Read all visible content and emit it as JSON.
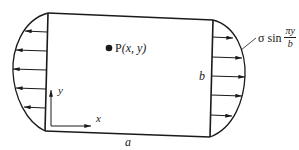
{
  "diagram": {
    "labels": {
      "point": "P(x, y)",
      "point_letter": "P",
      "point_args": "(x, y)",
      "height": "b",
      "width": "a",
      "x_axis": "x",
      "y_axis": "y",
      "load_prefix": "σ sin",
      "load_numerator": "πy",
      "load_denominator": "b"
    },
    "colors": {
      "stroke": "#1a1a1a",
      "background": "#ffffff"
    },
    "loads": {
      "left_edge": {
        "direction": "left",
        "arrow_count": 5,
        "distribution": "sinusoidal"
      },
      "right_edge": {
        "direction": "right",
        "arrow_count": 5,
        "distribution": "sinusoidal"
      }
    }
  }
}
